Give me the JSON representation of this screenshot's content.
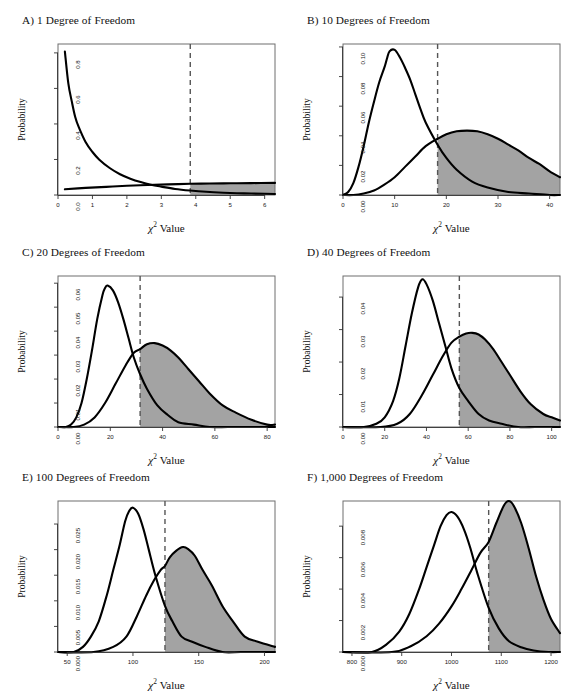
{
  "figure": {
    "axis_label_x": "Value",
    "axis_label_x_symbol": "χ",
    "axis_label_x_sup": "2",
    "axis_label_y": "Probability",
    "fill_color": "#a3a3a3",
    "curve_color": "#000000",
    "frame_color": "#6e6e6e",
    "critical_line_color": "#555555"
  },
  "chart_data": [
    {
      "id": "A",
      "type": "area",
      "title": "A) 1 Degree of Freedom",
      "df": 1,
      "xlabel": "χ² Value",
      "ylabel": "Probability",
      "xlim": [
        0,
        6.3
      ],
      "ylim": [
        0,
        0.85
      ],
      "xticks": [
        0,
        1,
        2,
        3,
        4,
        5,
        6
      ],
      "xticklabels": [
        "0",
        "1",
        "2",
        "3",
        "4",
        "5",
        "6"
      ],
      "yticks": [
        0.0,
        0.2,
        0.4,
        0.6,
        0.8
      ],
      "yticklabels": [
        "0.0",
        "0.2",
        "0.4",
        "0.6",
        "0.8"
      ],
      "critical_value": 3.84,
      "grid": false,
      "legend": "none",
      "series": [
        {
          "name": "null distribution (central chi-square, df=1)",
          "x": [
            0.2,
            0.3,
            0.4,
            0.5,
            0.6,
            0.8,
            1.0,
            1.2,
            1.5,
            1.8,
            2.1,
            2.4,
            2.7,
            3.0,
            3.4,
            3.84,
            4.3,
            4.8,
            5.4,
            6.0,
            6.3
          ],
          "y": [
            0.807,
            0.628,
            0.527,
            0.439,
            0.383,
            0.298,
            0.242,
            0.199,
            0.152,
            0.117,
            0.092,
            0.073,
            0.058,
            0.047,
            0.034,
            0.025,
            0.018,
            0.013,
            0.009,
            0.007,
            0.006
          ]
        },
        {
          "name": "alternative distribution (noncentral chi-square)",
          "x": [
            0.2,
            0.8,
            1.4,
            2.0,
            2.6,
            3.2,
            3.84,
            4.4,
            5.0,
            5.6,
            6.3
          ],
          "y": [
            0.032,
            0.04,
            0.046,
            0.052,
            0.056,
            0.06,
            0.063,
            0.065,
            0.066,
            0.067,
            0.068
          ]
        }
      ],
      "shaded_region": {
        "from": 3.84,
        "to": 6.3,
        "description": "power region under alternative distribution beyond critical value"
      }
    },
    {
      "id": "B",
      "type": "area",
      "title": "B) 10 Degrees of Freedom",
      "df": 10,
      "xlabel": "χ² Value",
      "ylabel": "Probability",
      "xlim": [
        0,
        42
      ],
      "ylim": [
        0,
        0.102
      ],
      "xticks": [
        0,
        10,
        20,
        30,
        40
      ],
      "xticklabels": [
        "0",
        "10",
        "20",
        "30",
        "40"
      ],
      "yticks": [
        0.0,
        0.02,
        0.04,
        0.06,
        0.08,
        0.1
      ],
      "yticklabels": [
        "0.00",
        "0.02",
        "0.04",
        "0.06",
        "0.08",
        "0.10"
      ],
      "critical_value": 18.31,
      "grid": false,
      "legend": "none",
      "series": [
        {
          "name": "null distribution (central chi-square, df=10)",
          "x": [
            0,
            1,
            2,
            3,
            4,
            5,
            6,
            7,
            8,
            8.5,
            9,
            10,
            11,
            12,
            13,
            14,
            15,
            16,
            18.31,
            20,
            22,
            25,
            28,
            32,
            36,
            40,
            42
          ],
          "y": [
            0.0,
            0.002,
            0.008,
            0.019,
            0.033,
            0.049,
            0.063,
            0.076,
            0.086,
            0.092,
            0.097,
            0.098,
            0.093,
            0.086,
            0.078,
            0.068,
            0.058,
            0.049,
            0.034,
            0.025,
            0.017,
            0.009,
            0.005,
            0.002,
            0.001,
            0.0,
            0.0
          ]
        },
        {
          "name": "alternative distribution (noncentral chi-square)",
          "x": [
            0,
            2,
            4,
            6,
            8,
            10,
            12,
            14,
            16,
            18.31,
            20,
            22,
            24,
            26,
            28,
            30,
            32,
            34,
            36,
            38,
            40,
            42
          ],
          "y": [
            0.0,
            0.0,
            0.001,
            0.003,
            0.007,
            0.012,
            0.019,
            0.026,
            0.033,
            0.038,
            0.041,
            0.043,
            0.0435,
            0.043,
            0.041,
            0.038,
            0.034,
            0.03,
            0.025,
            0.021,
            0.016,
            0.012
          ]
        }
      ],
      "shaded_region": {
        "from": 18.31,
        "to": 42,
        "description": "power region"
      }
    },
    {
      "id": "C",
      "type": "area",
      "title": "C) 20 Degrees of Freedom",
      "df": 20,
      "xlabel": "χ² Value",
      "ylabel": "Probability",
      "xlim": [
        0,
        83
      ],
      "ylim": [
        0,
        0.063
      ],
      "xticks": [
        0,
        20,
        40,
        60,
        80
      ],
      "xticklabels": [
        "0",
        "20",
        "40",
        "60",
        "80"
      ],
      "yticks": [
        0.0,
        0.01,
        0.02,
        0.03,
        0.04,
        0.05,
        0.06
      ],
      "yticklabels": [
        "0.00",
        "0.01",
        "0.02",
        "0.03",
        "0.04",
        "0.05",
        "0.06"
      ],
      "critical_value": 31.41,
      "grid": false,
      "legend": "none",
      "series": [
        {
          "name": "null distribution (central chi-square, df=20)",
          "x": [
            0,
            3,
            5,
            7,
            9,
            11,
            13,
            15,
            17,
            18,
            19,
            21,
            23,
            25,
            27,
            29,
            31.41,
            34,
            38,
            42,
            46,
            52,
            58,
            65,
            72,
            80,
            83
          ],
          "y": [
            0.0,
            0.0,
            0.001,
            0.004,
            0.01,
            0.02,
            0.032,
            0.045,
            0.055,
            0.058,
            0.059,
            0.057,
            0.052,
            0.045,
            0.037,
            0.029,
            0.022,
            0.016,
            0.009,
            0.005,
            0.002,
            0.001,
            0.0,
            0.0,
            0.0,
            0.0,
            0.0
          ]
        },
        {
          "name": "alternative distribution (noncentral chi-square)",
          "x": [
            0,
            6,
            10,
            14,
            18,
            22,
            26,
            29,
            31.41,
            34,
            37,
            40,
            43,
            46,
            50,
            54,
            58,
            63,
            68,
            74,
            80,
            83
          ],
          "y": [
            0.0,
            0.0,
            0.001,
            0.004,
            0.01,
            0.018,
            0.026,
            0.031,
            0.0325,
            0.0345,
            0.035,
            0.034,
            0.032,
            0.029,
            0.024,
            0.019,
            0.014,
            0.009,
            0.006,
            0.003,
            0.001,
            0.001
          ]
        }
      ],
      "shaded_region": {
        "from": 31.41,
        "to": 83,
        "description": "power region"
      }
    },
    {
      "id": "D",
      "type": "area",
      "title": "D) 40 Degrees of Freedom",
      "df": 40,
      "xlabel": "χ² Value",
      "ylabel": "Probability",
      "xlim": [
        0,
        104
      ],
      "ylim": [
        0,
        0.0465
      ],
      "xticks": [
        0,
        20,
        40,
        60,
        80,
        100
      ],
      "xticklabels": [
        "0",
        "20",
        "40",
        "60",
        "80",
        "100"
      ],
      "yticks": [
        0.0,
        0.01,
        0.02,
        0.03,
        0.04
      ],
      "yticklabels": [
        "0.00",
        "0.01",
        "0.02",
        "0.03",
        "0.04"
      ],
      "critical_value": 55.76,
      "grid": false,
      "legend": "none",
      "series": [
        {
          "name": "null distribution (central chi-square, df=40)",
          "x": [
            0,
            10,
            16,
            20,
            24,
            27,
            30,
            33,
            36,
            38,
            40,
            43,
            46,
            49,
            52,
            55.76,
            60,
            65,
            70,
            76,
            84,
            92,
            100,
            104
          ],
          "y": [
            0.0,
            0.0,
            0.001,
            0.003,
            0.008,
            0.015,
            0.025,
            0.035,
            0.043,
            0.0455,
            0.044,
            0.039,
            0.032,
            0.025,
            0.018,
            0.012,
            0.008,
            0.004,
            0.002,
            0.001,
            0.0,
            0.0,
            0.0,
            0.0
          ]
        },
        {
          "name": "alternative distribution (noncentral chi-square)",
          "x": [
            0,
            18,
            26,
            32,
            38,
            43,
            48,
            52,
            55.76,
            59,
            62,
            65,
            68,
            72,
            76,
            80,
            85,
            90,
            96,
            100,
            104
          ],
          "y": [
            0.0,
            0.0,
            0.001,
            0.004,
            0.01,
            0.016,
            0.022,
            0.026,
            0.0278,
            0.0288,
            0.029,
            0.0285,
            0.027,
            0.024,
            0.02,
            0.016,
            0.011,
            0.007,
            0.004,
            0.003,
            0.002
          ]
        }
      ],
      "shaded_region": {
        "from": 55.76,
        "to": 104,
        "description": "power region"
      }
    },
    {
      "id": "E",
      "type": "area",
      "title": "E) 100 Degrees of Freedom",
      "df": 100,
      "xlabel": "χ² Value",
      "ylabel": "Probability",
      "xlim": [
        43,
        208
      ],
      "ylim": [
        0,
        0.0295
      ],
      "xticks": [
        50,
        100,
        150,
        200
      ],
      "xticklabels": [
        "50",
        "100",
        "150",
        "200"
      ],
      "yticks": [
        0.0,
        0.005,
        0.01,
        0.015,
        0.02,
        0.025
      ],
      "yticklabels": [
        "0.000",
        "0.005",
        "0.010",
        "0.015",
        "0.020",
        "0.025"
      ],
      "critical_value": 124.34,
      "grid": false,
      "legend": "none",
      "series": [
        {
          "name": "null distribution (central chi-square, df=100)",
          "x": [
            43,
            55,
            62,
            68,
            74,
            80,
            85,
            90,
            94,
            97,
            100,
            104,
            108,
            112,
            117,
            124.34,
            130,
            137,
            145,
            155,
            168,
            182,
            196,
            208
          ],
          "y": [
            0.0,
            0.0,
            0.001,
            0.003,
            0.006,
            0.011,
            0.016,
            0.021,
            0.0255,
            0.0275,
            0.0282,
            0.027,
            0.024,
            0.02,
            0.015,
            0.009,
            0.006,
            0.003,
            0.002,
            0.001,
            0.0,
            0.0,
            0.0,
            0.0
          ]
        },
        {
          "name": "alternative distribution (noncentral chi-square)",
          "x": [
            43,
            70,
            85,
            95,
            103,
            110,
            116,
            121,
            124.34,
            128,
            133,
            138,
            142,
            147,
            153,
            160,
            168,
            176,
            185,
            195,
            208
          ],
          "y": [
            0.0,
            0.0,
            0.001,
            0.003,
            0.007,
            0.011,
            0.014,
            0.016,
            0.0168,
            0.0185,
            0.0198,
            0.0205,
            0.0201,
            0.0188,
            0.016,
            0.013,
            0.009,
            0.006,
            0.003,
            0.002,
            0.001
          ]
        }
      ],
      "shaded_region": {
        "from": 124.34,
        "to": 208,
        "description": "power region"
      }
    },
    {
      "id": "F",
      "type": "area",
      "title": "F) 1,000 Degrees of Freedom",
      "df": 1000,
      "xlabel": "χ² Value",
      "ylabel": "Probability",
      "xlim": [
        782,
        1218
      ],
      "ylim": [
        0,
        0.0096
      ],
      "xticks": [
        800,
        900,
        1000,
        1100,
        1200
      ],
      "xticklabels": [
        "800",
        "900",
        "1000",
        "1100",
        "1200"
      ],
      "yticks": [
        0.0,
        0.002,
        0.004,
        0.006,
        0.008
      ],
      "yticklabels": [
        "0.000",
        "0.002",
        "0.004",
        "0.006",
        "0.008"
      ],
      "critical_value": 1074.68,
      "grid": false,
      "legend": "none",
      "series": [
        {
          "name": "null distribution (central chi-square, df=1000)",
          "x": [
            782,
            840,
            870,
            895,
            915,
            935,
            950,
            965,
            978,
            990,
            1000,
            1012,
            1025,
            1038,
            1052,
            1074.68,
            1095,
            1115,
            1140,
            1165,
            1195,
            1218
          ],
          "y": [
            0.0,
            0.0,
            0.0005,
            0.0013,
            0.0024,
            0.004,
            0.0054,
            0.0068,
            0.008,
            0.0087,
            0.0089,
            0.0086,
            0.0078,
            0.0066,
            0.005,
            0.0028,
            0.0015,
            0.0007,
            0.0003,
            0.0001,
            0.0,
            0.0
          ]
        },
        {
          "name": "alternative distribution (noncentral chi-square)",
          "x": [
            782,
            880,
            920,
            950,
            975,
            1000,
            1020,
            1040,
            1058,
            1074.68,
            1090,
            1105,
            1115,
            1125,
            1140,
            1155,
            1170,
            1185,
            1200,
            1218
          ],
          "y": [
            0.0,
            0.0,
            0.0004,
            0.001,
            0.0018,
            0.0029,
            0.004,
            0.0052,
            0.0063,
            0.007,
            0.0082,
            0.0093,
            0.0096,
            0.0093,
            0.0082,
            0.0066,
            0.0048,
            0.0033,
            0.0021,
            0.0012
          ]
        }
      ],
      "shaded_region": {
        "from": 1074.68,
        "to": 1218,
        "description": "power region"
      }
    }
  ]
}
